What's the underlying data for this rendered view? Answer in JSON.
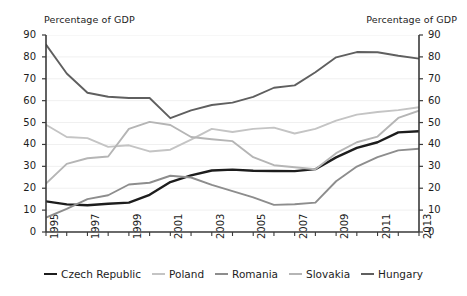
{
  "axis_captions": {
    "left": "Percentage of GDP",
    "right": "Percentage of GDP"
  },
  "chart_data": {
    "type": "line",
    "title": "",
    "subtitle": "",
    "xlabel": "",
    "ylabel": "Percentage of GDP",
    "ylabel_right": "Percentage of GDP",
    "xlim": [
      1995,
      2013
    ],
    "ylim": [
      0,
      90
    ],
    "ytick_values": [
      0,
      10,
      20,
      30,
      40,
      50,
      60,
      70,
      80,
      90
    ],
    "ytick_labels": [
      "0",
      "10",
      "20",
      "30",
      "40",
      "50",
      "60",
      "70",
      "80",
      "90"
    ],
    "right_axis_mirrors_left": true,
    "grid": "horizontal-faint",
    "legend_position": "bottom-center",
    "x": [
      1995,
      1996,
      1997,
      1998,
      1999,
      2000,
      2001,
      2002,
      2003,
      2004,
      2005,
      2006,
      2007,
      2008,
      2009,
      2010,
      2011,
      2012,
      2013
    ],
    "xtick_labels": [
      "1995",
      "",
      "1997",
      "",
      "1999",
      "",
      "2001",
      "",
      "2003",
      "",
      "2005",
      "",
      "2007",
      "",
      "2009",
      "",
      "2011",
      "",
      "2013"
    ],
    "series": [
      {
        "name": "Czech Republic",
        "color": "#1d1d1d",
        "width": 2.4,
        "values": [
          14.0,
          12.6,
          12.2,
          12.9,
          13.4,
          17.0,
          22.8,
          25.9,
          28.1,
          28.5,
          28.0,
          27.9,
          27.8,
          28.7,
          34.1,
          38.4,
          41.0,
          45.5,
          46.0
        ]
      },
      {
        "name": "Poland",
        "color": "#c4c4c4",
        "width": 1.9,
        "values": [
          49.0,
          43.4,
          42.9,
          38.9,
          39.6,
          36.8,
          37.6,
          42.2,
          47.1,
          45.7,
          47.1,
          47.7,
          45.0,
          47.1,
          50.9,
          53.6,
          54.8,
          55.7,
          57.0
        ]
      },
      {
        "name": "Romania",
        "color": "#8d8d8d",
        "width": 1.9,
        "values": [
          6.6,
          10.6,
          15.0,
          16.8,
          21.7,
          22.5,
          25.7,
          24.9,
          21.5,
          18.7,
          15.8,
          12.4,
          12.7,
          13.4,
          23.2,
          29.9,
          34.2,
          37.3,
          38.0
        ]
      },
      {
        "name": "Slovakia",
        "color": "#b5b5b5",
        "width": 1.9,
        "values": [
          22.1,
          31.1,
          33.7,
          34.5,
          47.1,
          50.3,
          48.9,
          43.4,
          42.4,
          41.5,
          34.2,
          30.5,
          29.6,
          28.7,
          36.0,
          41.0,
          43.6,
          52.1,
          55.4
        ]
      },
      {
        "name": "Hungary",
        "color": "#5f5f5f",
        "width": 1.9,
        "values": [
          85.6,
          72.4,
          63.6,
          61.8,
          61.2,
          61.2,
          52.0,
          55.6,
          58.0,
          59.1,
          61.7,
          65.9,
          67.0,
          73.0,
          79.8,
          82.2,
          82.1,
          80.5,
          79.2
        ]
      }
    ]
  },
  "legend": {
    "items": [
      {
        "label": "Czech Republic",
        "color": "#1d1d1d",
        "width": 2.6
      },
      {
        "label": "Poland",
        "color": "#c4c4c4",
        "width": 2.0
      },
      {
        "label": "Romania",
        "color": "#8d8d8d",
        "width": 2.0
      },
      {
        "label": "Slovakia",
        "color": "#b5b5b5",
        "width": 2.0
      },
      {
        "label": "Hungary",
        "color": "#5f5f5f",
        "width": 2.0
      }
    ]
  }
}
